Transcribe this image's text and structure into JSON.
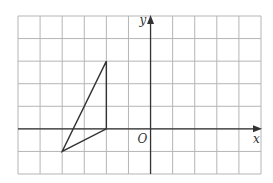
{
  "figure": {
    "type": "coordinate-grid-with-triangle",
    "grid": {
      "columns": 11,
      "rows": 7,
      "x_min": -6,
      "x_max": 5,
      "y_min": -2,
      "y_max": 5,
      "line_color": "#b5b5b5"
    },
    "axes": {
      "x_label": "x",
      "y_label": "y",
      "origin_label": "O",
      "color": "#333333"
    },
    "triangle": {
      "vertices": [
        [
          -2,
          3
        ],
        [
          -2,
          0
        ],
        [
          -4,
          -1
        ]
      ],
      "stroke": "#333333"
    }
  }
}
